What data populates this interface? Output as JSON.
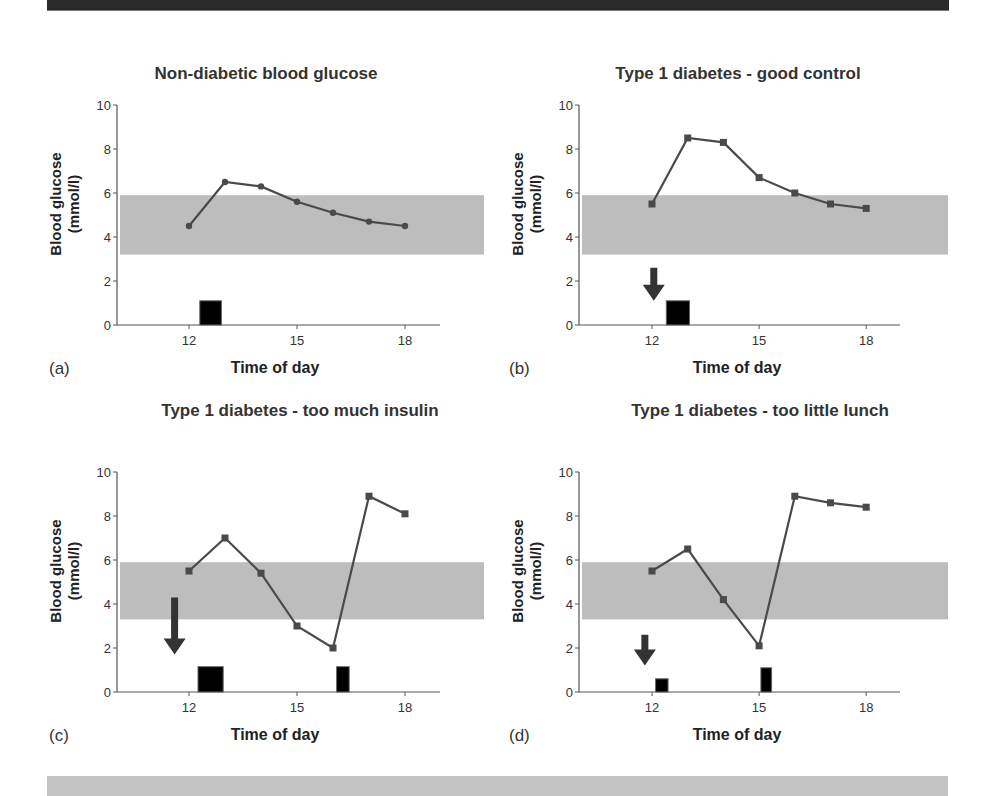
{
  "figure": {
    "band_color": "#bdbdbd",
    "line_color": "#4a4a4a",
    "bar_color": "#000000",
    "arrow_color": "#333333"
  },
  "panels": [
    {
      "id": "a",
      "letter": "(a)",
      "title": "Non-diabetic blood glucose",
      "xlabel": "Time of day",
      "ylabel_line1": "Blood glucose",
      "ylabel_line2": "(mmol/l)"
    },
    {
      "id": "b",
      "letter": "(b)",
      "title": "Type 1 diabetes - good control",
      "xlabel": "Time of day",
      "ylabel_line1": "Blood glucose",
      "ylabel_line2": "(mmol/l)"
    },
    {
      "id": "c",
      "letter": "(c)",
      "title": "Type 1 diabetes - too much insulin",
      "xlabel": "Time of day",
      "ylabel_line1": "Blood glucose",
      "ylabel_line2": "(mmol/l)"
    },
    {
      "id": "d",
      "letter": "(d)",
      "title": "Type 1 diabetes - too little lunch",
      "xlabel": "Time of day",
      "ylabel_line1": "Blood glucose",
      "ylabel_line2": "(mmol/l)"
    }
  ],
  "chart_data": [
    {
      "type": "line",
      "title": "Non-diabetic blood glucose",
      "xlabel": "Time of day",
      "ylabel": "Blood glucose (mmol/l)",
      "xlim": [
        10,
        19
      ],
      "ylim": [
        0,
        10
      ],
      "xticks": [
        12,
        15,
        18
      ],
      "yticks": [
        0,
        2,
        4,
        6,
        8,
        10
      ],
      "normal_range": [
        3.2,
        5.9
      ],
      "marker": "circle",
      "x": [
        12,
        13,
        14,
        15,
        16,
        17,
        18
      ],
      "values": [
        4.5,
        6.5,
        6.3,
        5.6,
        5.1,
        4.7,
        4.5
      ],
      "meals": [
        {
          "start": 12.3,
          "end": 12.9,
          "height": 1.1
        }
      ],
      "insulin_arrows": []
    },
    {
      "type": "line",
      "title": "Type 1 diabetes - good control",
      "xlabel": "Time of day",
      "ylabel": "Blood glucose (mmol/l)",
      "xlim": [
        10,
        19
      ],
      "ylim": [
        0,
        10
      ],
      "xticks": [
        12,
        15,
        18
      ],
      "yticks": [
        0,
        2,
        4,
        6,
        8,
        10
      ],
      "normal_range": [
        3.2,
        5.9
      ],
      "marker": "square",
      "x": [
        12,
        13,
        14,
        15,
        16,
        17,
        18
      ],
      "values": [
        5.5,
        8.5,
        8.3,
        6.7,
        6.0,
        5.5,
        5.3
      ],
      "meals": [
        {
          "start": 12.4,
          "end": 13.05,
          "height": 1.1
        }
      ],
      "insulin_arrows": [
        {
          "x": 12.05,
          "top": 2.6,
          "bottom": 1.1
        }
      ]
    },
    {
      "type": "line",
      "title": "Type 1 diabetes - too much insulin",
      "xlabel": "Time of day",
      "ylabel": "Blood glucose (mmol/l)",
      "xlim": [
        10,
        19
      ],
      "ylim": [
        0,
        10
      ],
      "xticks": [
        12,
        15,
        18
      ],
      "yticks": [
        0,
        2,
        4,
        6,
        8,
        10
      ],
      "normal_range": [
        3.3,
        5.9
      ],
      "marker": "square",
      "x": [
        12,
        13,
        14,
        15,
        16,
        17,
        18
      ],
      "values": [
        5.5,
        7.0,
        5.4,
        3.0,
        2.0,
        8.9,
        8.1
      ],
      "meals": [
        {
          "start": 12.25,
          "end": 12.95,
          "height": 1.15
        },
        {
          "start": 16.1,
          "end": 16.45,
          "height": 1.15
        }
      ],
      "insulin_arrows": [
        {
          "x": 11.6,
          "top": 4.3,
          "bottom": 1.7
        }
      ]
    },
    {
      "type": "line",
      "title": "Type 1 diabetes - too little lunch",
      "xlabel": "Time of day",
      "ylabel": "Blood glucose (mmol/l)",
      "xlim": [
        10,
        19
      ],
      "ylim": [
        0,
        10
      ],
      "xticks": [
        12,
        15,
        18
      ],
      "yticks": [
        0,
        2,
        4,
        6,
        8,
        10
      ],
      "normal_range": [
        3.3,
        5.9
      ],
      "marker": "square",
      "x": [
        12,
        13,
        14,
        15,
        16,
        17,
        18
      ],
      "values": [
        5.5,
        6.5,
        4.2,
        2.1,
        8.9,
        8.6,
        8.4
      ],
      "meals": [
        {
          "start": 12.1,
          "end": 12.45,
          "height": 0.6
        },
        {
          "start": 15.05,
          "end": 15.35,
          "height": 1.1
        }
      ],
      "insulin_arrows": [
        {
          "x": 11.8,
          "top": 2.6,
          "bottom": 1.2
        }
      ]
    }
  ]
}
